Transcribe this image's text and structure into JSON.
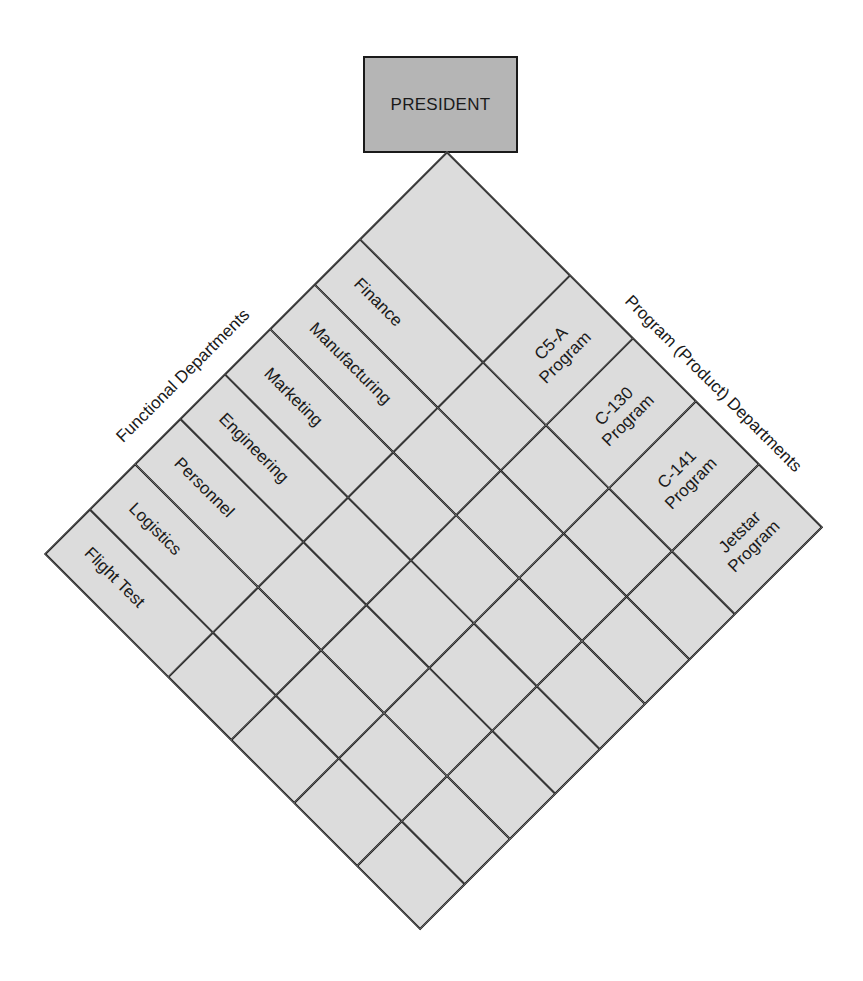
{
  "president": {
    "label": "PRESIDENT"
  },
  "sections": {
    "functional": "Functional Departments",
    "program": "Program (Product) Departments"
  },
  "matrix": {
    "column_widths": [
      174,
      89,
      89,
      89,
      89
    ],
    "row_heights": [
      123,
      63.6,
      63.6,
      63.6,
      63.6,
      63.6,
      63.6,
      63.6
    ],
    "functional_departments": [
      "Finance",
      "Manufacturing",
      "Marketing",
      "Engineering",
      "Personnel",
      "Logistics",
      "Flight Test"
    ],
    "program_departments": [
      {
        "line1": "C5-A",
        "line2": "Program"
      },
      {
        "line1": "C-130",
        "line2": "Program"
      },
      {
        "line1": "C-141",
        "line2": "Program"
      },
      {
        "line1": "Jetstar",
        "line2": "Program"
      }
    ]
  },
  "colors": {
    "president_fill": "#b5b5b5",
    "matrix_fill": "#dcdcdc",
    "line": "#1a1a1a",
    "background": "#ffffff"
  }
}
